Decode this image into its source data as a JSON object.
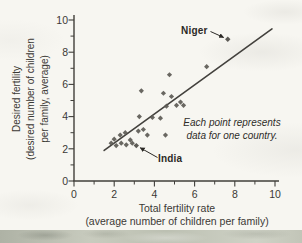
{
  "figure": {
    "background": "#f7f6f1",
    "scan_edge_color": "#bfc3b6"
  },
  "chart_data": {
    "type": "scatter",
    "title": "",
    "xlabel_lines": [
      "Total fertility rate",
      "(average number of children per family)"
    ],
    "ylabel_lines": [
      "Desired fertility",
      "(desired number of children",
      "per family, average)"
    ],
    "xlim": [
      0,
      10
    ],
    "ylim": [
      0,
      10
    ],
    "xticks": [
      0,
      2,
      4,
      6,
      8,
      10
    ],
    "yticks": [
      0,
      2,
      4,
      6,
      8,
      10
    ],
    "minor_xticks": [
      1,
      3,
      5,
      7,
      9
    ],
    "minor_yticks": [
      1,
      3,
      5,
      7,
      9
    ],
    "grid": false,
    "legend": "none",
    "annotation": [
      "Each point represents",
      "data for one country."
    ],
    "points": [
      [
        1.85,
        2.35
      ],
      [
        2.0,
        2.6
      ],
      [
        2.1,
        2.2
      ],
      [
        2.3,
        2.85
      ],
      [
        2.35,
        2.35
      ],
      [
        2.55,
        3.0
      ],
      [
        2.6,
        2.25
      ],
      [
        2.8,
        2.55
      ],
      [
        2.9,
        2.35
      ],
      [
        3.2,
        3.1
      ],
      [
        3.45,
        3.2
      ],
      [
        3.65,
        2.85
      ],
      [
        4.55,
        2.85
      ],
      [
        3.25,
        4.0
      ],
      [
        3.35,
        5.6
      ],
      [
        3.9,
        3.95
      ],
      [
        4.3,
        3.9
      ],
      [
        4.45,
        5.45
      ],
      [
        4.6,
        4.65
      ],
      [
        4.85,
        5.25
      ],
      [
        5.1,
        4.7
      ],
      [
        5.3,
        4.9
      ],
      [
        5.45,
        4.7
      ],
      [
        4.75,
        6.6
      ],
      [
        6.6,
        7.1
      ]
    ],
    "labeled_points": [
      {
        "label": "Niger",
        "x": 7.65,
        "y": 8.8
      },
      {
        "label": "India",
        "x": 3.1,
        "y": 2.2
      }
    ],
    "trend_line": {
      "x1": 1.5,
      "y1": 1.9,
      "x2": 9.85,
      "y2": 9.45
    },
    "colors": {
      "marker": "#5c5a55",
      "trend_line": "#43413d",
      "axis": "#413f3a",
      "tick_text": "#3b3935",
      "label_text": "#2b2926"
    }
  }
}
